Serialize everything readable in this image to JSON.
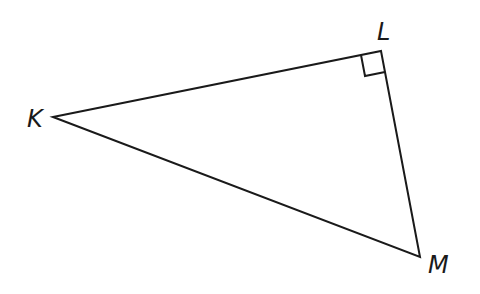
{
  "diagram": {
    "type": "right-triangle",
    "vertices": {
      "K": {
        "label": "K",
        "x": 53,
        "y": 117
      },
      "L": {
        "label": "L",
        "x": 381,
        "y": 51
      },
      "M": {
        "label": "M",
        "x": 420,
        "y": 257
      }
    },
    "right_angle_at": "L",
    "labels": {
      "K": "K",
      "L": "L",
      "M": "M"
    },
    "stroke_color": "#1a1a1a"
  }
}
